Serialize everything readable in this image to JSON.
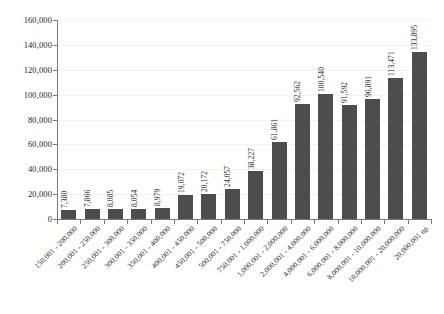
{
  "chart_data": {
    "type": "bar",
    "title": "",
    "xlabel": "",
    "ylabel": "",
    "ylim": [
      0,
      160000
    ],
    "ytick_labels": [
      "0",
      "20,000",
      "40,000",
      "60,000",
      "80,000",
      "100,000",
      "120,000",
      "140,000",
      "160,000"
    ],
    "ytick_values": [
      0,
      20000,
      40000,
      60000,
      80000,
      100000,
      120000,
      140000,
      160000
    ],
    "grid": true,
    "legend": "none",
    "bar_color": "#4d4d4d",
    "categories": [
      "150,001 - 200,000",
      "200,001 - 250,000",
      "250,001 - 300,000",
      "300,001 - 350,000",
      "350,001 - 400,000",
      "400,001 - 450,000",
      "450,001 - 500,000",
      "500,001 - 750,000",
      "750,001 - 1,000,000",
      "1,000,001 - 2,000,000",
      "2,000,001 - 4,000,000",
      "4,000,001 - 6,000,000",
      "6,000,001 - 8,000,000",
      "8,000,001 - 10,000,000",
      "10,000,001 - 20,000,000",
      "20,000,001 up"
    ],
    "values": [
      7380,
      7866,
      8085,
      8054,
      8979,
      19072,
      20172,
      24057,
      38227,
      61861,
      92562,
      100540,
      91592,
      96891,
      113471,
      133895
    ],
    "value_labels": [
      "7,380",
      "7,866",
      "8,085",
      "8,054",
      "8,979",
      "19,072",
      "20,172",
      "24,057",
      "38,227",
      "61,861",
      "92,562",
      "100,540",
      "91,592",
      "96,891",
      "113,471",
      "133,895"
    ]
  }
}
